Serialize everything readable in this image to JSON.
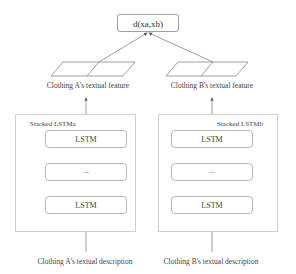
{
  "distance": {
    "label": "d(x_a, x_b)",
    "display": "d(xa,xb)"
  },
  "left": {
    "feature_label": "Clothing A's textual feature",
    "stack_title": "Stacked LSTM_a",
    "stack_title_display": "Stacked LSTMa",
    "cells": [
      "LSTM",
      "...",
      "LSTM"
    ],
    "input_label": "Clothing A's textual description"
  },
  "right": {
    "feature_label": "Clothing B's textual feature",
    "stack_title": "Stacked LSTM_b",
    "stack_title_display": "Stacked LSTMb",
    "cells": [
      "LSTM",
      "...",
      "LSTM"
    ],
    "input_label": "Clothing B's textual description"
  }
}
